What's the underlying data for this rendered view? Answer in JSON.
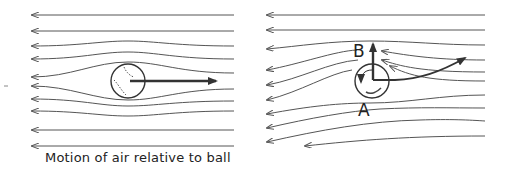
{
  "figure": {
    "left_panel": {
      "caption": "Motion of air relative to ball",
      "description": "Non-spinning ball moving right; symmetric streamlines flowing left around ball"
    },
    "right_panel": {
      "labels": {
        "top": "B",
        "bottom": "A"
      },
      "description": "Spinning ball; asymmetric streamlines, curved trajectory arrow upward-right, upward force arrow at B"
    },
    "colors": {
      "line": "#444444",
      "arrow": "#333333",
      "background": "#ffffff"
    }
  }
}
